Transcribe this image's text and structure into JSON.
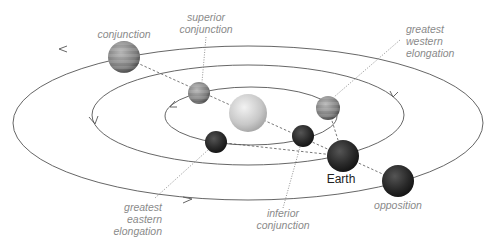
{
  "diagram": {
    "labels": {
      "conjunction": "conjunction",
      "superior_conjunction_1": "superior",
      "superior_conjunction_2": "conjunction",
      "greatest_western_1": "greatest",
      "greatest_western_2": "western",
      "greatest_western_3": "elongation",
      "greatest_eastern_1": "greatest",
      "greatest_eastern_2": "eastern",
      "greatest_eastern_3": "elongation",
      "inferior_1": "inferior",
      "inferior_2": "conjunction",
      "earth": "Earth",
      "opposition": "opposition"
    },
    "orbits": [
      "inner planet orbit",
      "Earth orbit",
      "outer planet orbit"
    ],
    "bodies": [
      "Sun",
      "Earth",
      "inner planet",
      "outer planet"
    ],
    "colors": {
      "orbit": "#555555",
      "label": "#8a8a8a",
      "sun": "#cfcfcf",
      "dark_planet": "#2a2a2a",
      "banded_planet": "#7a7a7a"
    }
  }
}
